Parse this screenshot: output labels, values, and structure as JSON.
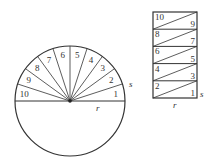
{
  "circle_figure": {
    "center": [
      70,
      101
    ],
    "radius": 55,
    "sector_labels": [
      "1",
      "2",
      "3",
      "4",
      "5",
      "6",
      "7",
      "8",
      "9",
      "10"
    ],
    "side_label": "s",
    "radius_label": "r"
  },
  "rectangle_figure": {
    "rows": [
      {
        "left": "10",
        "right": "9"
      },
      {
        "left": "8",
        "right": "7"
      },
      {
        "left": "6",
        "right": "5"
      },
      {
        "left": "4",
        "right": "3"
      },
      {
        "left": "2",
        "right": "1"
      }
    ],
    "side_label": "s",
    "bottom_label": "r"
  },
  "colors": {
    "stroke": "#333333",
    "background": "#ffffff"
  }
}
